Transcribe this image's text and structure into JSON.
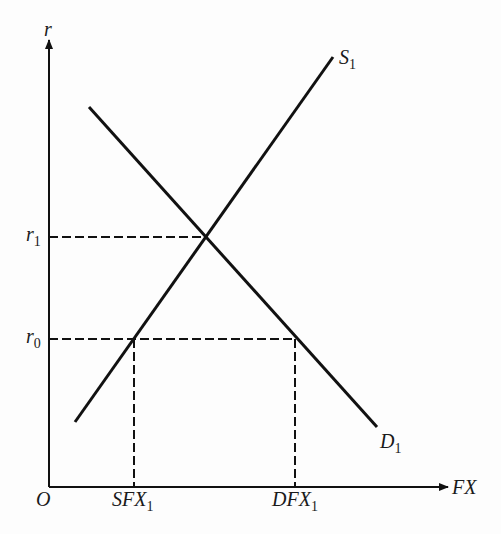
{
  "diagram": {
    "type": "supply-demand",
    "axes": {
      "y_label": "r",
      "x_label": "FX",
      "origin_label": "O"
    },
    "curves": [
      {
        "name": "S",
        "subscript": "1",
        "kind": "supply",
        "slope": "upward"
      },
      {
        "name": "D",
        "subscript": "1",
        "kind": "demand",
        "slope": "downward"
      }
    ],
    "y_levels": [
      {
        "name": "r",
        "subscript": "1",
        "meaning": "equilibrium rate"
      },
      {
        "name": "r",
        "subscript": "0",
        "meaning": "lower rate"
      }
    ],
    "x_levels": [
      {
        "name": "SFX",
        "subscript": "1",
        "meaning": "quantity supplied at r0"
      },
      {
        "name": "DFX",
        "subscript": "1",
        "meaning": "quantity demanded at r0"
      }
    ],
    "colors": {
      "line": "#111111",
      "background": "#fdfdfd"
    }
  }
}
